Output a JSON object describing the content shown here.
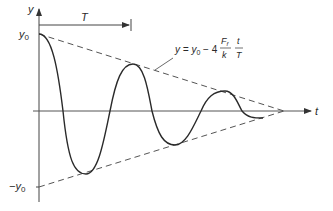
{
  "diagram": {
    "axes": {
      "y_label": "y",
      "t_label": "t",
      "y0_label": "y",
      "y0_sub": "0",
      "neg_y0_label": "−y",
      "neg_y0_sub": "0"
    },
    "period_label": "T",
    "envelope_equation": {
      "lhs": "y = y",
      "lhs_sub": "0",
      "minus_coeff": " − 4",
      "frac1_num": "F",
      "frac1_num_sub": "f",
      "frac1_den": "k",
      "frac2_num": "t",
      "frac2_den": "T"
    },
    "colors": {
      "curve": "#2a2a2a",
      "axis": "#555555",
      "envelope": "#555555"
    }
  }
}
